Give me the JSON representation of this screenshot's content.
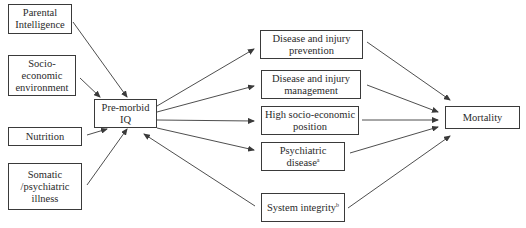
{
  "diagram": {
    "colors": {
      "line": "#3a3a3a",
      "border": "#3a3a3a",
      "text": "#2a2a2a",
      "background": "#ffffff"
    },
    "nodes": {
      "parental": {
        "lines": [
          "Parental",
          "Intelligence"
        ]
      },
      "socio_env": {
        "lines": [
          "Socio-",
          "economic",
          "environment"
        ]
      },
      "nutrition": {
        "lines": [
          "Nutrition"
        ]
      },
      "somatic": {
        "lines": [
          "Somatic",
          "/psychiatric",
          "illness"
        ]
      },
      "premorbid_iq": {
        "lines": [
          "Pre-morbid",
          "IQ"
        ]
      },
      "prevention": {
        "lines": [
          "Disease and injury",
          "prevention"
        ]
      },
      "management": {
        "lines": [
          "Disease and injury",
          "management"
        ]
      },
      "high_ses": {
        "lines": [
          "High socio-economic",
          "position"
        ]
      },
      "psychiatric": {
        "lines": [
          "Psychiatric",
          "disease"
        ],
        "superscript": "a"
      },
      "system_integrity": {
        "lines": [
          "System integrity"
        ],
        "superscript": "b"
      },
      "mortality": {
        "lines": [
          "Mortality"
        ]
      }
    },
    "edges": [
      {
        "from": "Parental Intelligence",
        "to": "Pre-morbid IQ"
      },
      {
        "from": "Socio-economic environment",
        "to": "Pre-morbid IQ"
      },
      {
        "from": "Nutrition",
        "to": "Pre-morbid IQ"
      },
      {
        "from": "Somatic/psychiatric illness",
        "to": "Pre-morbid IQ"
      },
      {
        "from": "System integrity",
        "to": "Pre-morbid IQ"
      },
      {
        "from": "Pre-morbid IQ",
        "to": "Disease and injury prevention"
      },
      {
        "from": "Pre-morbid IQ",
        "to": "Disease and injury management"
      },
      {
        "from": "Pre-morbid IQ",
        "to": "High socio-economic position"
      },
      {
        "from": "Pre-morbid IQ",
        "to": "Psychiatric disease"
      },
      {
        "from": "Disease and injury prevention",
        "to": "Mortality"
      },
      {
        "from": "Disease and injury management",
        "to": "Mortality"
      },
      {
        "from": "High socio-economic position",
        "to": "Mortality"
      },
      {
        "from": "Psychiatric disease",
        "to": "Mortality"
      },
      {
        "from": "System integrity",
        "to": "Mortality"
      }
    ]
  }
}
